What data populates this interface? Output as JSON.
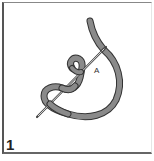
{
  "figure": {
    "step_number": "1",
    "point_label": "A",
    "colors": {
      "thread_fill": "#8a8a8a",
      "thread_outline": "#333333",
      "needle": "#555555",
      "frame": "#555555",
      "background": "#ffffff"
    }
  }
}
